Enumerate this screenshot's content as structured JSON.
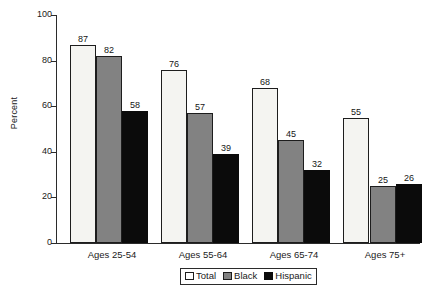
{
  "chart_data": {
    "type": "bar",
    "title": "",
    "subtitle": "",
    "xlabel": "",
    "ylabel": "Percent",
    "ylim": [
      0,
      100
    ],
    "yticks": [
      0,
      20,
      40,
      60,
      80,
      100
    ],
    "ytick_labels": [
      "0",
      "20",
      "40",
      "60",
      "80",
      "100"
    ],
    "grid": false,
    "legend_position": "bottom-center",
    "categories": [
      "Ages 25-54",
      "Ages 55-64",
      "Ages 65-74",
      "Ages 75+"
    ],
    "series": [
      {
        "name": "Total",
        "color": "#f4f4f1",
        "values": [
          87,
          76,
          68,
          55
        ]
      },
      {
        "name": "Black",
        "color": "#828282",
        "values": [
          82,
          57,
          45,
          25
        ]
      },
      {
        "name": "Hispanic",
        "color": "#0b0b0b",
        "values": [
          58,
          39,
          32,
          26
        ]
      }
    ],
    "data_labels": [
      [
        "87",
        "82",
        "58"
      ],
      [
        "76",
        "57",
        "39"
      ],
      [
        "68",
        "45",
        "32"
      ],
      [
        "55",
        "25",
        "26"
      ]
    ]
  },
  "axis": {
    "y_title": "Percent",
    "y_ticks": [
      "100",
      "80",
      "60",
      "40",
      "20",
      "0"
    ],
    "x_categories": [
      "Ages 25-54",
      "Ages 55-64",
      "Ages 65-74",
      "Ages 75+"
    ]
  },
  "legend": {
    "items": [
      {
        "label": "Total",
        "swatch": "legend-swatch-total"
      },
      {
        "label": "Black",
        "swatch": "legend-swatch-black"
      },
      {
        "label": "Hispanic",
        "swatch": "legend-swatch-hispanic"
      }
    ]
  }
}
